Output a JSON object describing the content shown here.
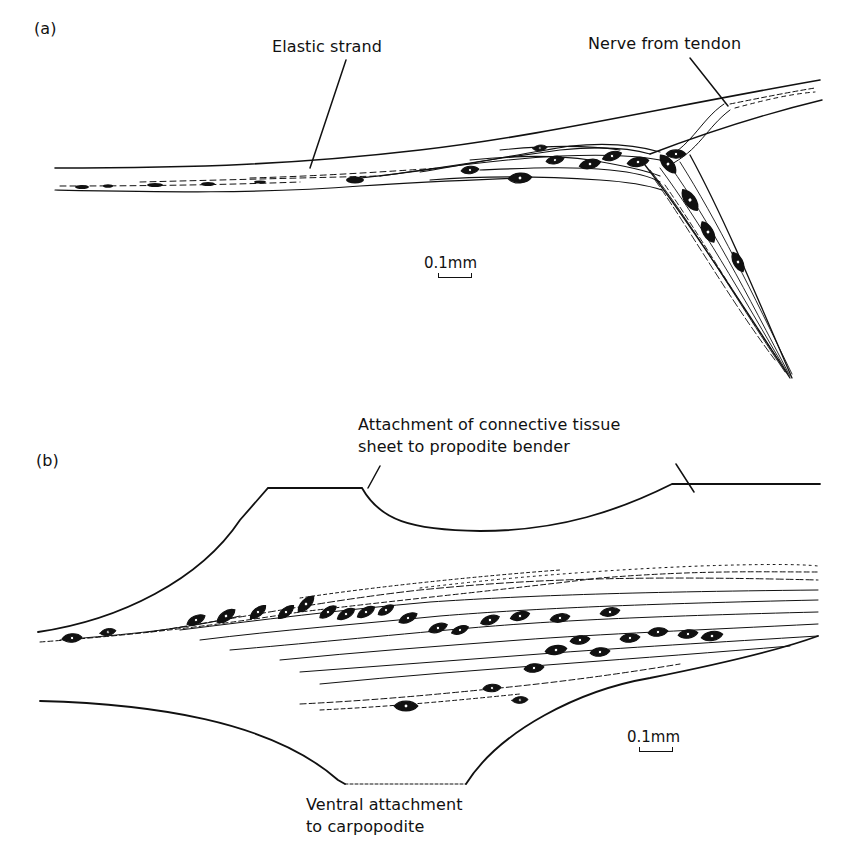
{
  "figure": {
    "panel_a": {
      "label": "(a)",
      "annotations": {
        "elastic_strand": "Elastic strand",
        "nerve_from_tendon": "Nerve from tendon"
      },
      "scale_bar": "0.1mm"
    },
    "panel_b": {
      "label": "(b)",
      "annotations": {
        "attachment_line1": "Attachment of connective tissue",
        "attachment_line2": "sheet to propodite bender",
        "ventral_line1": "Ventral attachment",
        "ventral_line2": "to carpopodite"
      },
      "scale_bar": "0.1mm"
    }
  },
  "colors": {
    "ink": "#111111",
    "paper": "#ffffff"
  }
}
